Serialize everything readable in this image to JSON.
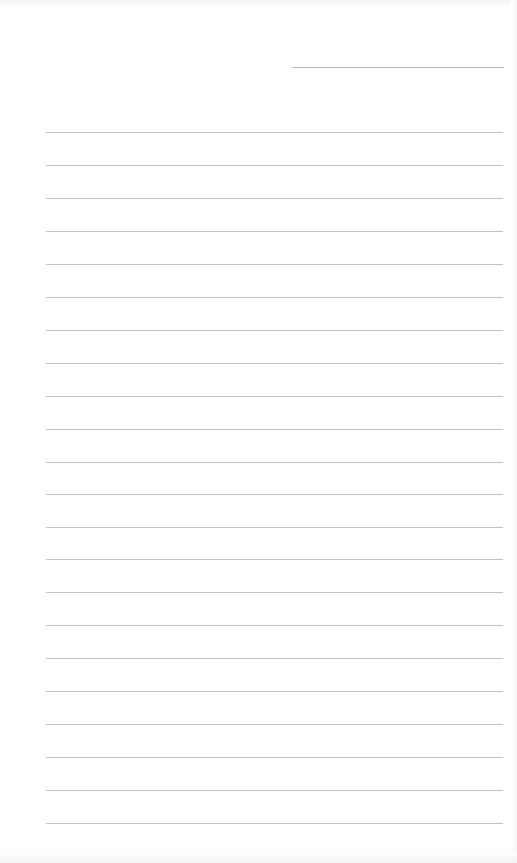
{
  "page": {
    "type": "blank-lined-paper",
    "background_color": "#ffffff",
    "line_color": "#c4c4c4",
    "name_line_color": "#b8b8b8"
  },
  "name_line": {
    "x_start": 292,
    "x_end": 504,
    "y": 67
  },
  "ruled_lines": {
    "count": 22,
    "x_start": 46,
    "x_end": 503,
    "y_positions": [
      132,
      165,
      198,
      231,
      264,
      297,
      330,
      363,
      396,
      429,
      462,
      494,
      527,
      559,
      592,
      625,
      658,
      691,
      724,
      757,
      790,
      823
    ]
  }
}
